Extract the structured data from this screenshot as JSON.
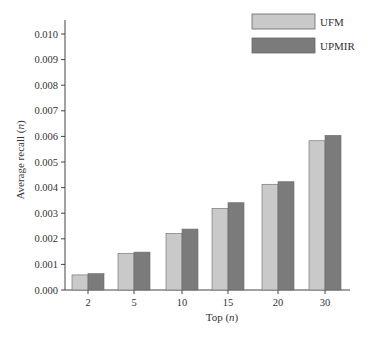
{
  "chart_data": {
    "type": "bar",
    "title": "",
    "xlabel": "Top (n)",
    "ylabel": "Average recall (n)",
    "categories": [
      "2",
      "5",
      "10",
      "15",
      "20",
      "30"
    ],
    "series": [
      {
        "name": "UFM",
        "color": "#c9c9c9",
        "values": [
          0.00059,
          0.00143,
          0.00221,
          0.00319,
          0.00413,
          0.00583
        ]
      },
      {
        "name": "UPMIR",
        "color": "#7b7b7b",
        "values": [
          0.00064,
          0.00148,
          0.00238,
          0.00341,
          0.00423,
          0.00604
        ]
      }
    ],
    "ylim": [
      0,
      0.01
    ],
    "yticks": [
      "0.000",
      "0.001",
      "0.002",
      "0.003",
      "0.004",
      "0.005",
      "0.006",
      "0.007",
      "0.008",
      "0.009",
      "0.010"
    ],
    "grid": false,
    "legend_position": "top-right"
  },
  "axes": {
    "xlabel_main": "Top (",
    "xlabel_var": "n",
    "xlabel_close": ")",
    "ylabel_main": "Average recall (",
    "ylabel_var": "n",
    "ylabel_close": ")"
  },
  "legend": {
    "items": [
      {
        "label": "UFM",
        "color": "#c9c9c9"
      },
      {
        "label": "UPMIR",
        "color": "#7b7b7b"
      }
    ]
  }
}
